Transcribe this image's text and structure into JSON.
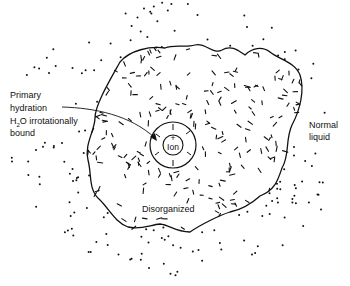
{
  "diagram": {
    "type": "ion hydration structure",
    "labels": {
      "primary_line1": "Primary",
      "primary_line2": "hydration",
      "primary_line3_h": "H",
      "primary_line3_sub": "2",
      "primary_line3_rest": "O irrotationally",
      "primary_line4": "bound",
      "normal_line1": "Normal",
      "normal_line2": "liquid",
      "disorganized": "Disorganized",
      "ion": "Ion",
      "ion_charge": "+"
    },
    "regions": [
      {
        "name": "ion",
        "description": "central cation"
      },
      {
        "name": "primary-hydration-shell",
        "description": "H2O irrotationally bound"
      },
      {
        "name": "disorganized-region",
        "description": "randomly oriented water molecules"
      },
      {
        "name": "normal-liquid",
        "description": "bulk water, dots"
      }
    ],
    "colors": {
      "ink": "#111111",
      "background": "#ffffff"
    }
  }
}
